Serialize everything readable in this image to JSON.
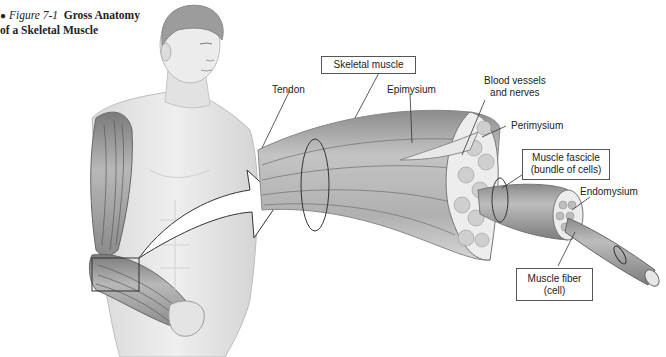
{
  "caption": {
    "bullet": "●",
    "figure_number": "Figure 7-1",
    "title_line1": "Gross Anatomy",
    "title_line2": "of a Skeletal Muscle"
  },
  "labels": {
    "skeletal_muscle": "Skeletal muscle",
    "tendon": "Tendon",
    "epimysium": "Epimysium",
    "blood_vessels_line1": "Blood vessels",
    "blood_vessels_line2": "and nerves",
    "perimysium": "Perimysium",
    "fascicle_line1": "Muscle fascicle",
    "fascicle_line2": "(bundle of cells)",
    "endomysium": "Endomysium",
    "fiber_line1": "Muscle fiber",
    "fiber_line2": "(cell)"
  },
  "colors": {
    "skin": "#e6e6e6",
    "skin_shadow": "#c8c8c8",
    "muscle": "#9a9a9a",
    "muscle_dark": "#6e6e6e",
    "line": "#333333",
    "box_border": "#555555"
  }
}
